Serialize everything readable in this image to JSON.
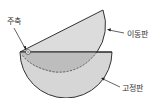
{
  "diagram": {
    "type": "variable-capacitor-plates",
    "labels": {
      "pivot": "주축",
      "movable_plate": "이동판",
      "fixed_plate": "고정판"
    },
    "colors": {
      "plate_fill": "#d9d9d9",
      "overlap_fill": "#bdbdbd",
      "outline": "#333333",
      "background": "#ffffff"
    }
  }
}
